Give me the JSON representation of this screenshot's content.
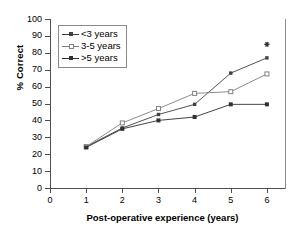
{
  "chart_data": {
    "type": "line",
    "title": "",
    "xlabel": "Post-operative experience (years)",
    "ylabel": "% Correct",
    "xlim": [
      0,
      6.5
    ],
    "ylim": [
      0,
      100
    ],
    "xticks": [
      0,
      1,
      2,
      3,
      4,
      5,
      6
    ],
    "yticks": [
      0,
      10,
      20,
      30,
      40,
      50,
      60,
      70,
      80,
      90,
      100
    ],
    "xtick_labels": [
      "0",
      "1",
      "2",
      "3",
      "4",
      "5",
      "6"
    ],
    "ytick_labels": [
      "0",
      "10",
      "20",
      "30",
      "40",
      "50",
      "60",
      "70",
      "80",
      "90",
      "100"
    ],
    "grid": false,
    "legend_position": "upper left",
    "x": [
      1,
      2,
      3,
      4,
      5,
      6
    ],
    "series": [
      {
        "name": "<3 years",
        "marker": "small-square",
        "color": "#404040",
        "values": [
          24.5,
          35.5,
          43.5,
          49.5,
          68,
          77
        ]
      },
      {
        "name": "3-5 years",
        "marker": "open-square",
        "color": "#808080",
        "values": [
          24.5,
          38.5,
          47,
          56,
          57,
          67.5
        ]
      },
      {
        "name": ">5 years",
        "marker": "filled-square",
        "color": "#303030",
        "values": [
          24,
          35,
          40,
          42,
          49.5,
          49.5
        ]
      }
    ],
    "annotations": [
      {
        "label": "*",
        "x": 6,
        "y": 85,
        "marker": "asterisk",
        "color": "#303030"
      }
    ]
  },
  "legend": {
    "items": [
      {
        "label": "<3 years"
      },
      {
        "label": "3-5 years"
      },
      {
        "label": ">5 years"
      }
    ]
  },
  "axes": {
    "y_title": "% Correct",
    "x_title": "Post-operative experience (years)"
  },
  "colors": {
    "axis": "#4d4d4d",
    "frame": "#8a8a8a",
    "series_1": "#404040",
    "series_2": "#808080",
    "series_3": "#303030",
    "text": "#000000",
    "background": "#ffffff"
  }
}
